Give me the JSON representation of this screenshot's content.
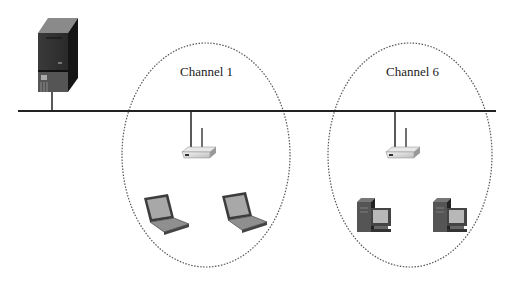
{
  "diagram": {
    "type": "wireless network topology",
    "backbone": {
      "label": "wired backbone"
    },
    "server": {
      "name": "server"
    },
    "cells": [
      {
        "label": "Channel 1",
        "access_point": "wireless access point",
        "clients": [
          "laptop",
          "laptop"
        ]
      },
      {
        "label": "Channel 6",
        "access_point": "wireless access point",
        "clients": [
          "desktop computer",
          "desktop computer"
        ]
      }
    ]
  }
}
